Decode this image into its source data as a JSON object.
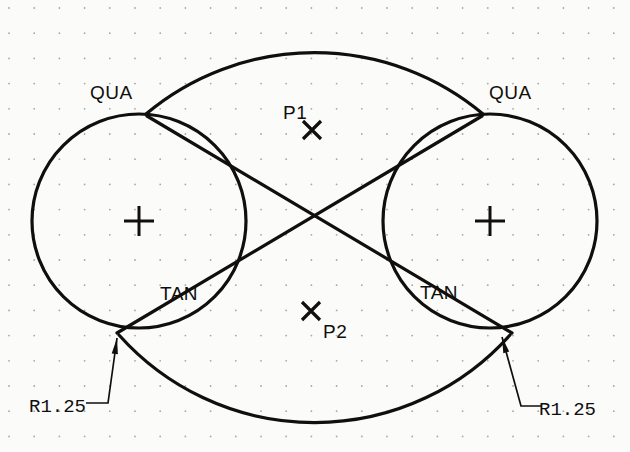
{
  "drawing": {
    "title": "Tangent and quadrant construction",
    "background_color": "#fbfbfa",
    "line_color": "#100f0d",
    "grid_dot_color": "#aaa6a0",
    "labels": {
      "qua_left": "QUA",
      "qua_right": "QUA",
      "tan_left": "TAN",
      "tan_right": "TAN",
      "point_1": "P1",
      "point_2": "P2",
      "radius_left": "R1.25",
      "radius_right": "R1.25"
    },
    "geometry": {
      "grid": {
        "spacing": 25.2,
        "origin_x": 9,
        "origin_y": 8,
        "dot_radius": 0.9
      },
      "left_circle": {
        "cx": 139,
        "cy": 221,
        "r": 107
      },
      "right_circle": {
        "cx": 490,
        "cy": 221,
        "r": 107
      },
      "top_arc": {
        "start_x": 146,
        "start_y": 114,
        "end_x": 483,
        "end_y": 114,
        "rx": 262,
        "ry": 262,
        "apex_x": 310,
        "apex_y": 38
      },
      "bottom_arc": {
        "start_x": 119,
        "start_y": 335,
        "end_x": 510,
        "end_y": 335,
        "rx": 262,
        "ry": 262,
        "apex_x": 310,
        "apex_y": 400
      },
      "cross_line_1": {
        "x1": 147,
        "y1": 116,
        "x2": 512,
        "y2": 333
      },
      "cross_line_2": {
        "x1": 117,
        "y1": 333,
        "x2": 482,
        "y2": 116
      },
      "center_mark_size": 15,
      "p1_mark": {
        "x": 312,
        "y": 130,
        "size": 9
      },
      "p2_mark": {
        "x": 311,
        "y": 311,
        "size": 9
      },
      "leader_left": {
        "tip_x": 117,
        "tip_y": 338,
        "elbow_x": 108,
        "elbow_y": 403,
        "end_x": 86,
        "end_y": 403
      },
      "leader_right": {
        "tip_x": 502,
        "tip_y": 337,
        "elbow_x": 521,
        "elbow_y": 406,
        "end_x": 541,
        "end_y": 406
      }
    },
    "label_positions": {
      "qua_left": {
        "x": 90,
        "y": 99
      },
      "qua_right": {
        "x": 489,
        "y": 99
      },
      "tan_left": {
        "x": 160,
        "y": 300
      },
      "tan_right": {
        "x": 420,
        "y": 299
      },
      "point_1": {
        "x": 283,
        "y": 119
      },
      "point_2": {
        "x": 323,
        "y": 338
      },
      "radius_left": {
        "x": 29,
        "y": 412
      },
      "radius_right": {
        "x": 539,
        "y": 415
      }
    }
  }
}
